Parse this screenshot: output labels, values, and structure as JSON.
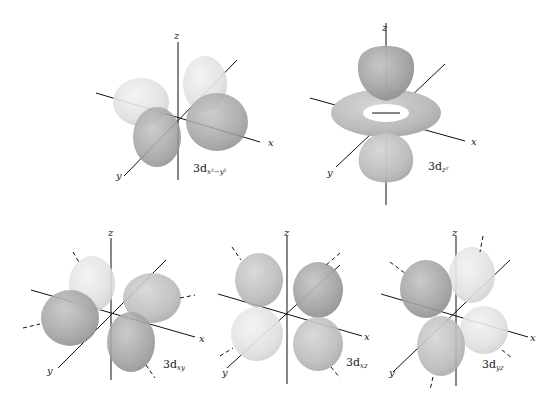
{
  "axis_labels": {
    "x": "x",
    "y": "y",
    "z": "z"
  },
  "orbitals": [
    {
      "id": "dx2-y2",
      "name": "3d",
      "subscript": "x²−y²"
    },
    {
      "id": "dz2",
      "name": "3d",
      "subscript": "z²"
    },
    {
      "id": "dxy",
      "name": "3d",
      "subscript": "xy"
    },
    {
      "id": "dxz",
      "name": "3d",
      "subscript": "xz"
    },
    {
      "id": "dyz",
      "name": "3d",
      "subscript": "yz"
    }
  ],
  "colors": {
    "lobe_dark": "#9a9a9a",
    "lobe_light": "#dcdcdc",
    "axis": "#111111",
    "background": "#ffffff"
  }
}
